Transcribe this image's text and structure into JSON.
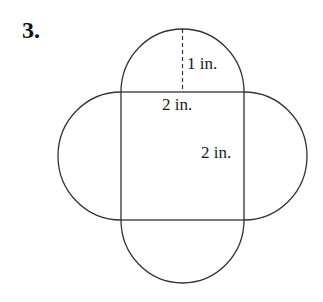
{
  "problem": {
    "number": "3."
  },
  "figure": {
    "labels": {
      "radius": "1 in.",
      "top_side": "2 in.",
      "right_side": "2 in."
    },
    "square_side": "2 in.",
    "semicircle_radius": "1 in.",
    "stroke_color": "#333333"
  }
}
